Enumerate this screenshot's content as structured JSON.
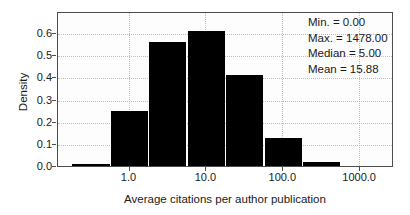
{
  "chart_data": {
    "type": "bar",
    "subtype": "histogram",
    "title": "",
    "xlabel": "Average citations per author publication",
    "ylabel": "Density",
    "x_scale": "log10",
    "x_tick_values_log10": [
      0,
      1,
      2,
      3
    ],
    "x_tick_labels": [
      "1.0",
      "10.0",
      "100.0",
      "1000.0"
    ],
    "y_tick_values": [
      0.0,
      0.1,
      0.2,
      0.3,
      0.4,
      0.5,
      0.6
    ],
    "y_tick_labels": [
      "0.0",
      "0.1",
      "0.2",
      "0.3",
      "0.4",
      "0.5",
      "0.6"
    ],
    "xlim_log10": [
      -0.93,
      3.44
    ],
    "ylim": [
      0,
      0.7
    ],
    "bin_edges_log10": [
      -0.75,
      -0.25,
      0.25,
      0.75,
      1.25,
      1.75,
      2.25,
      2.75
    ],
    "bin_centers_value": [
      0.32,
      1.0,
      3.16,
      10.0,
      31.6,
      100.0,
      316.2
    ],
    "densities": [
      0.01,
      0.25,
      0.56,
      0.61,
      0.41,
      0.125,
      0.02
    ],
    "bar_color": "#000000",
    "grid_style": "dotted",
    "grid_color": "#bdbdbd",
    "annotations": {
      "min": "Min. = 0.00",
      "max": "Max. = 1478.00",
      "median": "Median = 5.00",
      "mean": "Mean = 15.88"
    }
  }
}
